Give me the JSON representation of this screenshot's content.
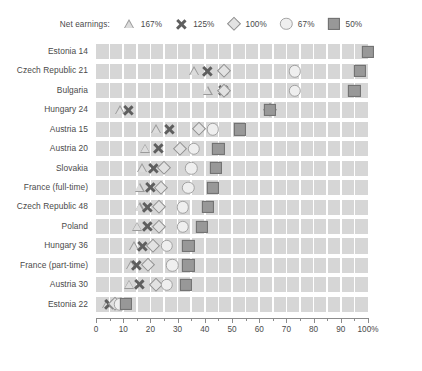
{
  "legend": {
    "title": "Net earnings:",
    "entries": [
      {
        "symbol": "triangle",
        "label": "167%"
      },
      {
        "symbol": "x",
        "label": "125%"
      },
      {
        "symbol": "diamond",
        "label": "100%"
      },
      {
        "symbol": "circle",
        "label": "67%"
      },
      {
        "symbol": "square",
        "label": "50%"
      }
    ]
  },
  "axis": {
    "tick_labels": [
      "0",
      "10",
      "20",
      "30",
      "40",
      "50",
      "60",
      "70",
      "80",
      "90",
      "100%"
    ],
    "tick_values": [
      0,
      10,
      20,
      30,
      40,
      50,
      60,
      70,
      80,
      90,
      100
    ],
    "minor_values": [
      5,
      15,
      25,
      35,
      45,
      55,
      65,
      75,
      85,
      95
    ],
    "min": 0,
    "max": 100
  },
  "colors": {
    "band": "#d6d6d6",
    "gridline": "#ffffff",
    "text": "#4a4a4a",
    "axis": "#8c8c8c",
    "square_fill": "#989898",
    "circle_fill": "#efefef",
    "diamond_stroke": "#8f8f8f",
    "triangle_stroke": "#9a9a9a",
    "x_color": "#5f5f5f"
  },
  "chart_data": {
    "type": "scatter",
    "title": "",
    "xlabel": "",
    "ylabel": "",
    "xlim": [
      0,
      100
    ],
    "grid": true,
    "legend_position": "top",
    "categories": [
      "Estonia 14",
      "Czech Republic 21",
      "Bulgaria",
      "Hungary 24",
      "Austria 15",
      "Austria 20",
      "Slovakia",
      "France (full-time)",
      "Czech Republic 48",
      "Poland",
      "Hungary 36",
      "France (part-time)",
      "Austria 30",
      "Estonia 22"
    ],
    "series": [
      {
        "name": "167%",
        "symbol": "triangle",
        "values": [
          null,
          36,
          41,
          9,
          22,
          18,
          17,
          16,
          16,
          15,
          14,
          13,
          12,
          4
        ]
      },
      {
        "name": "125%",
        "symbol": "x",
        "values": [
          100,
          41,
          47,
          12,
          27,
          23,
          21,
          20,
          19,
          19,
          17,
          15,
          16,
          5
        ]
      },
      {
        "name": "100%",
        "symbol": "diamond",
        "values": [
          null,
          47,
          47,
          64,
          38,
          31,
          25,
          24,
          23,
          23,
          21,
          19,
          22,
          7
        ]
      },
      {
        "name": "67%",
        "symbol": "circle",
        "values": [
          null,
          73,
          73,
          64,
          43,
          36,
          35,
          34,
          32,
          32,
          26,
          28,
          26,
          9
        ]
      },
      {
        "name": "50%",
        "symbol": "square",
        "values": [
          100,
          97,
          95,
          64,
          53,
          45,
          44,
          43,
          41,
          39,
          34,
          34,
          33,
          11
        ]
      }
    ]
  }
}
